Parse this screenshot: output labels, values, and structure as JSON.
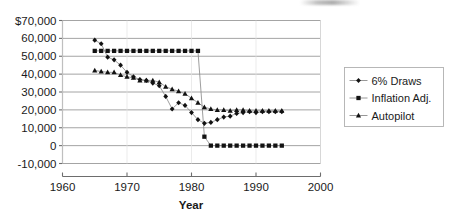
{
  "chart_data": {
    "type": "scatter",
    "title": "",
    "xlabel": "Year",
    "ylabel": "",
    "xlim": [
      1960,
      2000
    ],
    "ylim": [
      -10000,
      70000
    ],
    "grid": "horizontal",
    "legend_position": "right",
    "x_ticks": [
      "1960",
      "1970",
      "1980",
      "1990",
      "2000"
    ],
    "y_ticks": [
      "$70,000",
      "60,000",
      "50,000",
      "40,000",
      "30,000",
      "20,000",
      "10,000",
      "0",
      "-10,000"
    ],
    "x": [
      1965,
      1966,
      1967,
      1968,
      1969,
      1970,
      1971,
      1972,
      1973,
      1974,
      1975,
      1976,
      1977,
      1978,
      1979,
      1980,
      1981,
      1982,
      1983,
      1984,
      1985,
      1986,
      1987,
      1988,
      1989,
      1990,
      1991,
      1992,
      1993,
      1994
    ],
    "series": [
      {
        "name": "6% Draws",
        "marker": "diamond",
        "values": [
          59000,
          57000,
          49500,
          48000,
          45000,
          41000,
          38500,
          37000,
          36500,
          35000,
          33500,
          27500,
          20500,
          24000,
          22500,
          18500,
          14500,
          12500,
          13000,
          14500,
          16000,
          16500,
          18000,
          18500,
          19000,
          18500,
          19000,
          19000,
          19000,
          19000
        ]
      },
      {
        "name": "Inflation Adj.",
        "marker": "square",
        "values": [
          53000,
          53000,
          53000,
          53000,
          53000,
          53000,
          53000,
          53000,
          53000,
          53000,
          53000,
          53000,
          53000,
          53000,
          53000,
          53000,
          53000,
          5000,
          0,
          0,
          0,
          0,
          0,
          0,
          0,
          0,
          0,
          0,
          0,
          0
        ]
      },
      {
        "name": "Autopilot",
        "marker": "triangle",
        "values": [
          42000,
          41500,
          41000,
          41000,
          39500,
          38500,
          38000,
          36500,
          36500,
          36500,
          35500,
          33000,
          31500,
          30500,
          29000,
          26500,
          24000,
          21500,
          20500,
          20000,
          20000,
          19500,
          20000,
          20000,
          19500,
          19500,
          19500,
          19500,
          19500,
          19500
        ]
      }
    ]
  },
  "legend": {
    "entries": [
      {
        "label": "6% Draws",
        "marker": "diamond"
      },
      {
        "label": "Inflation Adj.",
        "marker": "square"
      },
      {
        "label": "Autopilot",
        "marker": "triangle"
      }
    ]
  }
}
